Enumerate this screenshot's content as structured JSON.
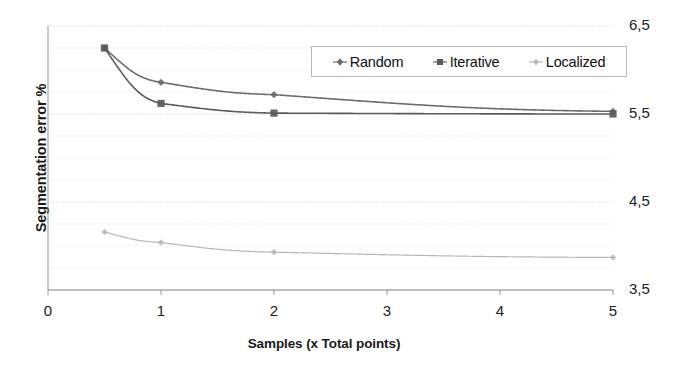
{
  "chart_data": {
    "type": "line",
    "title": "",
    "xlabel": "Samples  (x Total points)",
    "ylabel": "Segmentation error %",
    "xlim": [
      0,
      5
    ],
    "ylim": [
      3.5,
      6.5
    ],
    "xticks": [
      "0",
      "1",
      "2",
      "3",
      "4",
      "5"
    ],
    "xtick_values": [
      0,
      1,
      2,
      3,
      4,
      5
    ],
    "yticks": [
      "6,5",
      "5,5",
      "4,5",
      "3,5"
    ],
    "ytick_values": [
      6.5,
      5.5,
      4.5,
      3.5
    ],
    "grid": "horizontal dotted minor gridlines every 0.25",
    "legend_position": "top-center inside plot",
    "series": [
      {
        "name": "Random",
        "marker": "diamond",
        "color": "#6b6b6b",
        "x": [
          0.5,
          1.0,
          2.0,
          5.0
        ],
        "values": [
          6.25,
          5.86,
          5.72,
          5.53
        ]
      },
      {
        "name": "Iterative",
        "marker": "square",
        "color": "#5a5a5a",
        "x": [
          0.5,
          1.0,
          2.0,
          5.0
        ],
        "values": [
          6.25,
          5.62,
          5.51,
          5.5
        ]
      },
      {
        "name": "Localized",
        "marker": "diamond-light",
        "color": "#b5b5b5",
        "x": [
          0.5,
          1.0,
          2.0,
          5.0
        ],
        "values": [
          4.16,
          4.04,
          3.93,
          3.87
        ]
      }
    ]
  },
  "legend": {
    "items": [
      {
        "label": "Random"
      },
      {
        "label": "Iterative"
      },
      {
        "label": "Localized"
      }
    ]
  },
  "axes": {
    "y_title": "Segmentation error %",
    "x_title": "Samples  (x Total points)"
  },
  "colors": {
    "random": "#6b6b6b",
    "iterative": "#5a5a5a",
    "localized": "#b5b5b5",
    "grid": "#bfbfbf",
    "axis": "#8a8a8a",
    "text": "#1a1a1a"
  }
}
